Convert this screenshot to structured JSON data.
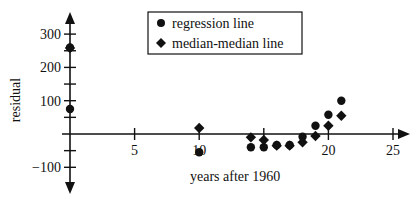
{
  "chart_data": {
    "type": "scatter",
    "title": "",
    "xlabel": "years after 1960",
    "ylabel": "residual",
    "xlim": [
      0,
      26
    ],
    "ylim": [
      -120,
      340
    ],
    "x_ticks": [
      5,
      10,
      15,
      20,
      25
    ],
    "x_tick_labels": [
      "5",
      "10",
      "",
      "20",
      "25"
    ],
    "y_ticks": [
      -100,
      -50,
      50,
      100,
      150,
      200,
      250,
      300
    ],
    "y_tick_labels": [
      {
        "value": 300,
        "label": "300"
      },
      {
        "value": 200,
        "label": "200"
      },
      {
        "value": 100,
        "label": "100"
      },
      {
        "value": -100,
        "label": "−100"
      }
    ],
    "grid": false,
    "legend_position": "top-center",
    "series": [
      {
        "name": "regression line",
        "marker": "circle",
        "points": [
          {
            "x": 0,
            "y": 260
          },
          {
            "x": 0,
            "y": 75
          },
          {
            "x": 10,
            "y": -55
          },
          {
            "x": 14,
            "y": -40
          },
          {
            "x": 15,
            "y": -40
          },
          {
            "x": 16,
            "y": -33
          },
          {
            "x": 17,
            "y": -33
          },
          {
            "x": 18,
            "y": -8
          },
          {
            "x": 19,
            "y": 25
          },
          {
            "x": 20,
            "y": 58
          },
          {
            "x": 21,
            "y": 100
          }
        ]
      },
      {
        "name": "median-median line",
        "marker": "diamond",
        "points": [
          {
            "x": 0,
            "y": 258
          },
          {
            "x": 10,
            "y": 18
          },
          {
            "x": 14,
            "y": -10
          },
          {
            "x": 15,
            "y": -18
          },
          {
            "x": 16,
            "y": -35
          },
          {
            "x": 17,
            "y": -35
          },
          {
            "x": 18,
            "y": -25
          },
          {
            "x": 19,
            "y": -6
          },
          {
            "x": 20,
            "y": 25
          },
          {
            "x": 21,
            "y": 55
          }
        ]
      }
    ]
  },
  "legend": {
    "items": [
      {
        "label": "regression line",
        "marker": "circle"
      },
      {
        "label": "median-median line",
        "marker": "diamond"
      }
    ]
  },
  "colors": {
    "ink": "#111111",
    "background": "#ffffff"
  }
}
